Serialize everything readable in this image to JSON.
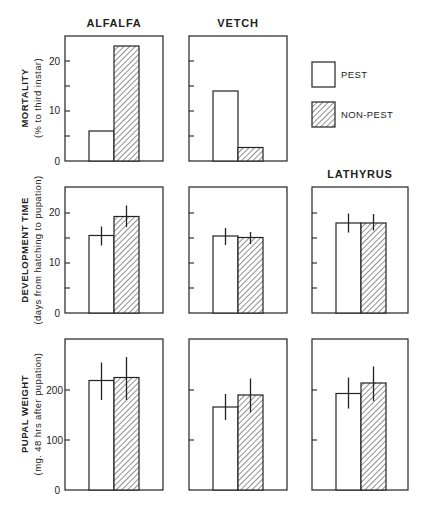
{
  "chart_data": {
    "type": "bar",
    "layout": "3x3 grid of small-multiple bar charts (rows = measures, columns = host plants); grid off",
    "legend": {
      "position": "top-right (row 1, column 3 slot)",
      "entries": [
        {
          "name": "PEST",
          "fill": "white"
        },
        {
          "name": "NON-PEST",
          "fill": "diagonal-hatch"
        }
      ]
    },
    "columns": [
      "ALFALFA",
      "VETCH",
      "LATHYRUS"
    ],
    "series_names": [
      "PEST",
      "NON-PEST"
    ],
    "panels": [
      {
        "row": 0,
        "title": "ALFALFA",
        "ylabel": "MORTALITY",
        "ylabel_sub": "(% to third instar)",
        "ylim": [
          0,
          25
        ],
        "yticks": [
          0,
          5,
          10,
          15,
          20
        ],
        "ytick_labels": [
          "0",
          "",
          "10",
          "",
          "20"
        ],
        "categories": [
          "PEST",
          "NON-PEST"
        ],
        "values": [
          6,
          23
        ],
        "errors": null
      },
      {
        "row": 0,
        "title": "VETCH",
        "ylim": [
          0,
          25
        ],
        "yticks": [
          0,
          5,
          10,
          15,
          20
        ],
        "categories": [
          "PEST",
          "NON-PEST"
        ],
        "values": [
          14,
          2.7
        ],
        "errors": null
      },
      {
        "row": 1,
        "title": "",
        "ylabel": "DEVELOPMENT TIME",
        "ylabel_sub": "(days from hatching to pupation)",
        "ylim": [
          0,
          25
        ],
        "yticks": [
          0,
          5,
          10,
          15,
          20
        ],
        "ytick_labels": [
          "0",
          "",
          "10",
          "",
          "20"
        ],
        "column": "ALFALFA",
        "categories": [
          "PEST",
          "NON-PEST"
        ],
        "values": [
          15.5,
          19.3
        ],
        "errors": [
          [
            13.5,
            17.3
          ],
          [
            17.2,
            21.5
          ]
        ]
      },
      {
        "row": 1,
        "column": "VETCH",
        "ylim": [
          0,
          25
        ],
        "yticks": [
          0,
          5,
          10,
          15,
          20
        ],
        "categories": [
          "PEST",
          "NON-PEST"
        ],
        "values": [
          15.4,
          15.1
        ],
        "errors": [
          [
            13.6,
            17.0
          ],
          [
            13.8,
            16.2
          ]
        ]
      },
      {
        "row": 1,
        "title": "LATHYRUS",
        "column": "LATHYRUS",
        "ylim": [
          0,
          25
        ],
        "yticks": [
          0,
          5,
          10,
          15,
          20
        ],
        "categories": [
          "PEST",
          "NON-PEST"
        ],
        "values": [
          18.0,
          18.0
        ],
        "errors": [
          [
            16.1,
            19.9
          ],
          [
            16.5,
            19.8
          ]
        ]
      },
      {
        "row": 2,
        "column": "ALFALFA",
        "ylabel": "PUPAL WEIGHT",
        "ylabel_sub": "(mg. 48 hrs after pupation)",
        "ylim": [
          0,
          300
        ],
        "yticks": [
          0,
          100,
          200
        ],
        "ytick_labels": [
          "0",
          "100",
          "200"
        ],
        "categories": [
          "PEST",
          "NON-PEST"
        ],
        "values": [
          219,
          225
        ],
        "errors": [
          [
            180,
            255
          ],
          [
            180,
            266
          ]
        ]
      },
      {
        "row": 2,
        "column": "VETCH",
        "ylim": [
          0,
          300
        ],
        "yticks": [
          0,
          100,
          200
        ],
        "categories": [
          "PEST",
          "NON-PEST"
        ],
        "values": [
          166,
          190
        ],
        "errors": [
          [
            140,
            192
          ],
          [
            155,
            223
          ]
        ]
      },
      {
        "row": 2,
        "column": "LATHYRUS",
        "ylim": [
          0,
          300
        ],
        "yticks": [
          0,
          100,
          200
        ],
        "categories": [
          "PEST",
          "NON-PEST"
        ],
        "values": [
          193,
          214
        ],
        "errors": [
          [
            163,
            225
          ],
          [
            178,
            247
          ]
        ]
      }
    ]
  },
  "titles": {
    "alfalfa": "ALFALFA",
    "vetch": "VETCH",
    "lathyrus": "LATHYRUS"
  },
  "legend": {
    "pest": "PEST",
    "non_pest": "NON-PEST"
  },
  "axes": {
    "mortality": {
      "label": "MORTALITY",
      "sub": "(% to third instar)",
      "ticks": [
        "0",
        "10",
        "20"
      ]
    },
    "development": {
      "label": "DEVELOPMENT TIME",
      "sub": "(days from hatching to pupation)",
      "ticks": [
        "0",
        "10",
        "20"
      ]
    },
    "pupal": {
      "label": "PUPAL WEIGHT",
      "sub": "(mg. 48 hrs after pupation)",
      "ticks": [
        "0",
        "100",
        "200"
      ]
    }
  }
}
